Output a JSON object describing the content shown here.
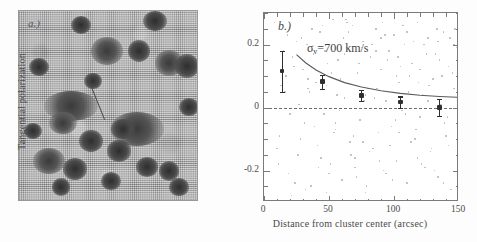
{
  "figure": {
    "panel_a": {
      "label": "a.)",
      "description": "grayscale-astronomical-image"
    },
    "panel_b": {
      "label": "b.)"
    }
  },
  "chart_data": {
    "type": "scatter",
    "title": "",
    "panel_label": "b.)",
    "xlabel": "Distance from cluster center (arcsec)",
    "ylabel": "Tangential polarization",
    "xlim": [
      0,
      150
    ],
    "ylim": [
      -0.3,
      0.3
    ],
    "xticks": [
      0,
      50,
      100,
      150
    ],
    "xtick_labels": [
      "0",
      "50",
      "100",
      "150"
    ],
    "yticks": [
      -0.2,
      0,
      0.2
    ],
    "ytick_labels": [
      "-0.2",
      "0",
      "0.2"
    ],
    "xminor_step": 10,
    "yminor_step": 0.05,
    "grid": false,
    "legend": "none",
    "annotations": [
      {
        "text_prefix": "σ",
        "subscript": "v",
        "text_suffix": "=700 km/s",
        "x": 33,
        "y": 0.185
      }
    ],
    "reference_line": {
      "y": 0,
      "style": "dashed",
      "color": "#6a6a6a"
    },
    "series": [
      {
        "name": "binned-tangential-polarization",
        "style": "points-with-errorbars",
        "color": "#2f2f2f",
        "x": [
          14,
          45,
          75,
          105,
          135
        ],
        "values": [
          0.115,
          0.082,
          0.038,
          0.017,
          0.0
        ],
        "yerr": [
          0.065,
          0.022,
          0.018,
          0.018,
          0.028
        ]
      },
      {
        "name": "model-fit-curve",
        "style": "line",
        "color": "#5a5a5a",
        "x": [
          25,
          32,
          40,
          50,
          62,
          75,
          90,
          105,
          120,
          135,
          150
        ],
        "values": [
          0.168,
          0.142,
          0.119,
          0.098,
          0.079,
          0.065,
          0.053,
          0.045,
          0.039,
          0.035,
          0.032
        ]
      },
      {
        "name": "individual-galaxy-measurements",
        "style": "faint-scatter",
        "color": "#b9b9b9",
        "points": [
          [
            8,
            0.27
          ],
          [
            12,
            -0.09
          ],
          [
            16,
            0.05
          ],
          [
            19,
            -0.21
          ],
          [
            23,
            0.13
          ],
          [
            26,
            -0.15
          ],
          [
            29,
            0.22
          ],
          [
            31,
            -0.05
          ],
          [
            34,
            0.09
          ],
          [
            36,
            -0.25
          ],
          [
            38,
            0.17
          ],
          [
            41,
            -0.12
          ],
          [
            43,
            0.24
          ],
          [
            46,
            -0.02
          ],
          [
            48,
            0.07
          ],
          [
            51,
            -0.18
          ],
          [
            53,
            0.28
          ],
          [
            55,
            -0.07
          ],
          [
            57,
            0.15
          ],
          [
            60,
            -0.23
          ],
          [
            62,
            0.03
          ],
          [
            64,
            0.19
          ],
          [
            66,
            -0.11
          ],
          [
            68,
            0.26
          ],
          [
            70,
            -0.16
          ],
          [
            72,
            0.11
          ],
          [
            74,
            -0.04
          ],
          [
            76,
            0.21
          ],
          [
            78,
            -0.27
          ],
          [
            80,
            0.06
          ],
          [
            82,
            0.16
          ],
          [
            84,
            -0.13
          ],
          [
            86,
            0.25
          ],
          [
            88,
            -0.08
          ],
          [
            90,
            0.12
          ],
          [
            92,
            -0.2
          ],
          [
            94,
            0.02
          ],
          [
            96,
            0.18
          ],
          [
            98,
            -0.06
          ],
          [
            100,
            0.23
          ],
          [
            102,
            -0.17
          ],
          [
            104,
            0.08
          ],
          [
            106,
            -0.01
          ],
          [
            108,
            0.2
          ],
          [
            110,
            -0.24
          ],
          [
            112,
            0.1
          ],
          [
            114,
            0.14
          ],
          [
            116,
            -0.1
          ],
          [
            118,
            0.27
          ],
          [
            120,
            -0.03
          ],
          [
            122,
            0.04
          ],
          [
            124,
            -0.19
          ],
          [
            126,
            0.22
          ],
          [
            128,
            -0.14
          ],
          [
            130,
            0.09
          ],
          [
            132,
            0.17
          ],
          [
            134,
            -0.22
          ],
          [
            136,
            0.01
          ],
          [
            138,
            0.24
          ],
          [
            140,
            -0.09
          ],
          [
            142,
            0.13
          ],
          [
            144,
            -0.26
          ],
          [
            146,
            0.06
          ],
          [
            148,
            0.19
          ],
          [
            15,
            0.18
          ],
          [
            21,
            -0.28
          ],
          [
            27,
            0.01
          ],
          [
            33,
            0.2
          ],
          [
            39,
            -0.06
          ],
          [
            45,
            0.26
          ],
          [
            50,
            -0.21
          ],
          [
            56,
            0.04
          ],
          [
            61,
            0.22
          ],
          [
            67,
            -0.15
          ],
          [
            73,
            0.14
          ],
          [
            79,
            -0.25
          ],
          [
            85,
            0.03
          ],
          [
            91,
            0.27
          ],
          [
            97,
            -0.12
          ],
          [
            103,
            0.16
          ],
          [
            109,
            -0.02
          ],
          [
            115,
            0.21
          ],
          [
            121,
            -0.18
          ],
          [
            127,
            0.07
          ],
          [
            133,
            0.25
          ],
          [
            139,
            -0.05
          ],
          [
            145,
            0.11
          ],
          [
            10,
            -0.13
          ],
          [
            18,
            0.23
          ],
          [
            24,
            -0.24
          ],
          [
            30,
            0.12
          ],
          [
            35,
            0.05
          ],
          [
            42,
            -0.19
          ],
          [
            47,
            0.18
          ],
          [
            54,
            -0.08
          ],
          [
            59,
            0.09
          ],
          [
            65,
            0.24
          ],
          [
            71,
            -0.22
          ],
          [
            77,
            0.02
          ],
          [
            83,
            0.2
          ],
          [
            89,
            -0.17
          ],
          [
            95,
            0.15
          ],
          [
            101,
            -0.04
          ],
          [
            107,
            0.26
          ],
          [
            113,
            -0.11
          ],
          [
            119,
            0.08
          ],
          [
            125,
            0.17
          ],
          [
            131,
            -0.2
          ],
          [
            137,
            0.1
          ],
          [
            143,
            0.22
          ],
          [
            13,
            0.07
          ],
          [
            22,
            0.16
          ],
          [
            28,
            -0.1
          ],
          [
            37,
            0.25
          ],
          [
            44,
            -0.16
          ],
          [
            52,
            0.11
          ],
          [
            58,
            -0.01
          ],
          [
            63,
            0.28
          ],
          [
            69,
            -0.09
          ],
          [
            75,
            0.19
          ],
          [
            81,
            -0.14
          ],
          [
            87,
            0.06
          ],
          [
            93,
            0.23
          ],
          [
            99,
            -0.23
          ],
          [
            105,
            0.13
          ],
          [
            111,
            0.05
          ],
          [
            117,
            -0.07
          ],
          [
            123,
            0.2
          ],
          [
            129,
            -0.13
          ],
          [
            135,
            0.15
          ],
          [
            141,
            -0.03
          ],
          [
            147,
            0.25
          ],
          [
            11,
            -0.18
          ],
          [
            17,
            0.1
          ],
          [
            25,
            0.21
          ],
          [
            32,
            -0.26
          ],
          [
            40,
            0.08
          ],
          [
            49,
            0.14
          ],
          [
            55,
            -0.05
          ],
          [
            64,
            0.27
          ],
          [
            70,
            -0.19
          ],
          [
            78,
            0.04
          ],
          [
            86,
            0.18
          ],
          [
            94,
            -0.21
          ],
          [
            102,
            0.1
          ],
          [
            110,
            0.24
          ],
          [
            118,
            -0.16
          ],
          [
            126,
            0.02
          ],
          [
            134,
            0.21
          ],
          [
            142,
            -0.12
          ],
          [
            149,
            0.16
          ],
          [
            20,
            -0.02
          ],
          [
            34,
            0.06
          ],
          [
            48,
            -0.27
          ],
          [
            62,
            0.17
          ],
          [
            76,
            -0.11
          ],
          [
            90,
            0.22
          ],
          [
            104,
            -0.08
          ],
          [
            120,
            0.12
          ],
          [
            138,
            -0.24
          ],
          [
            146,
            0.2
          ]
        ]
      }
    ]
  }
}
